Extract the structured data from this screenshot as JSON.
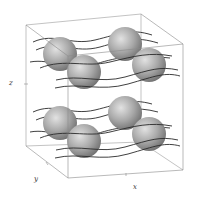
{
  "figure": {
    "type": "3d-schematic",
    "axes": {
      "x": "x",
      "y": "y",
      "z": "z"
    },
    "colors": {
      "box": "#8a8a8a",
      "lines": "#2a2a2a",
      "sphere_light": "#d8d8d8",
      "sphere_dark": "#7a7a7a",
      "background": "#ffffff"
    },
    "layers": [
      {
        "name": "top",
        "spheres": [
          {
            "cx": 60,
            "cy": 54,
            "r": 17
          },
          {
            "cx": 125,
            "cy": 44,
            "r": 17
          },
          {
            "cx": 84,
            "cy": 72,
            "r": 17
          },
          {
            "cx": 149,
            "cy": 65,
            "r": 17
          }
        ]
      },
      {
        "name": "bottom",
        "spheres": [
          {
            "cx": 60,
            "cy": 123,
            "r": 17
          },
          {
            "cx": 125,
            "cy": 113,
            "r": 17
          },
          {
            "cx": 84,
            "cy": 141,
            "r": 17
          },
          {
            "cx": 149,
            "cy": 134,
            "r": 17
          }
        ]
      }
    ]
  }
}
